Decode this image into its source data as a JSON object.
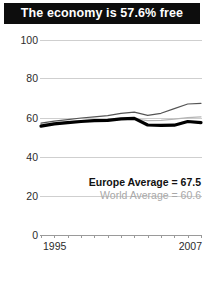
{
  "title": "The economy is 57.6% free",
  "legend": {
    "europe": "Europe Average = 67.5",
    "world": "World Average = 60.6"
  },
  "axis": {
    "y_ticks": [
      "100",
      "80",
      "60",
      "40",
      "20",
      "0"
    ],
    "x_start": "1995",
    "x_end": "2007"
  },
  "chart_data": {
    "type": "line",
    "title": "The economy is 57.6% free",
    "xlabel": "",
    "ylabel": "",
    "xlim": [
      1995,
      2007
    ],
    "ylim": [
      0,
      100
    ],
    "yticks": [
      0,
      20,
      40,
      60,
      80,
      100
    ],
    "grid": true,
    "legend_position": "bottom-right",
    "x": [
      1995,
      1996,
      1997,
      1998,
      1999,
      2000,
      2001,
      2002,
      2003,
      2004,
      2005,
      2006,
      2007
    ],
    "series": [
      {
        "name": "Country",
        "color": "#000000",
        "width": 3.2,
        "values": [
          55.8,
          57.0,
          57.6,
          58.2,
          58.6,
          58.8,
          59.6,
          59.8,
          56.4,
          56.2,
          56.3,
          58.2,
          57.6
        ]
      },
      {
        "name": "Europe Average",
        "color": "#555555",
        "width": 1.2,
        "values": [
          57.4,
          58.4,
          59.2,
          60.0,
          60.6,
          61.2,
          62.4,
          63.0,
          61.4,
          62.4,
          64.8,
          67.2,
          67.5
        ]
      },
      {
        "name": "World Average",
        "color": "#b5b5b5",
        "width": 1.2,
        "values": [
          56.6,
          57.4,
          58.0,
          58.6,
          58.8,
          59.0,
          59.4,
          59.6,
          58.6,
          58.8,
          59.4,
          60.2,
          60.6
        ]
      }
    ],
    "annotations": [
      {
        "text": "Europe Average = 67.5",
        "value": 67.5
      },
      {
        "text": "World Average = 60.6",
        "value": 60.6
      }
    ]
  }
}
